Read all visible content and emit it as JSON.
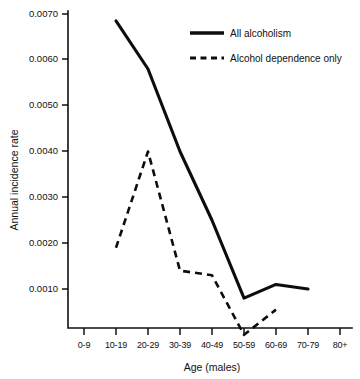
{
  "chart_data": {
    "type": "line",
    "title": "",
    "xlabel": "Age (males)",
    "ylabel": "Annual incidence rate",
    "categories": [
      "0-9",
      "10-19",
      "20-29",
      "30-39",
      "40-49",
      "50-59",
      "60-69",
      "70-79",
      "80+"
    ],
    "ytick_labels": [
      "0.0010",
      "0.0020",
      "0.0030",
      "0.0040",
      "0.0050",
      "0.0060",
      "0.0070"
    ],
    "ytick_values": [
      0.001,
      0.002,
      0.003,
      0.004,
      0.005,
      0.006,
      0.007
    ],
    "ylim": [
      0.0,
      0.0072
    ],
    "grid": false,
    "legend_position": "top-right",
    "series": [
      {
        "name": "All alcoholism",
        "style": "solid",
        "x": [
          "10-19",
          "20-29",
          "30-39",
          "40-49",
          "50-59",
          "60-69",
          "70-79"
        ],
        "values": [
          0.00685,
          0.0058,
          0.004,
          0.0025,
          0.0008,
          0.0011,
          0.001
        ]
      },
      {
        "name": "Alcohol dependence only",
        "style": "dashed",
        "x": [
          "10-19",
          "20-29",
          "30-39",
          "40-49",
          "50-59",
          "60-69"
        ],
        "values": [
          0.0019,
          0.004,
          0.0014,
          0.0013,
          0.0,
          0.00055
        ]
      }
    ]
  },
  "legend": {
    "items": [
      {
        "label": "All alcoholism",
        "style": "solid"
      },
      {
        "label": "Alcohol dependence only",
        "style": "dashed"
      }
    ]
  },
  "axes": {
    "y_title": "Annual incidence rate",
    "x_title": "Age (males)"
  }
}
